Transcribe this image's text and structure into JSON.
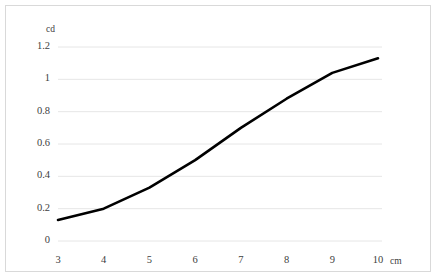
{
  "chart_data": {
    "type": "line",
    "title": "",
    "xlabel": "cm",
    "ylabel": "cd",
    "x": [
      3,
      4,
      5,
      6,
      7,
      8,
      9,
      10
    ],
    "values": [
      0.13,
      0.2,
      0.33,
      0.5,
      0.7,
      0.88,
      1.04,
      1.13
    ],
    "series": [
      {
        "name": "",
        "values": [
          0.13,
          0.2,
          0.33,
          0.5,
          0.7,
          0.88,
          1.04,
          1.13
        ]
      }
    ],
    "xlim": [
      3,
      10
    ],
    "ylim": [
      0,
      1.2
    ],
    "xticks": [
      "3",
      "4",
      "5",
      "6",
      "7",
      "8",
      "9",
      "10"
    ],
    "yticks": [
      "0",
      "0.2",
      "0.4",
      "0.6",
      "0.8",
      "1",
      "1.2"
    ],
    "ytick_values": [
      0,
      0.2,
      0.4,
      0.6,
      0.8,
      1,
      1.2
    ],
    "grid": "horizontal",
    "legend": "none",
    "line_color": "#000000",
    "grid_color": "#e6e6e6",
    "border_color": "#d9d9d9",
    "text_color": "#404040"
  },
  "axes": {
    "y_title": "cd",
    "x_title": "cm"
  },
  "y_ticks": [
    {
      "label": "1.2"
    },
    {
      "label": "1"
    },
    {
      "label": "0.8"
    },
    {
      "label": "0.6"
    },
    {
      "label": "0.4"
    },
    {
      "label": "0.2"
    },
    {
      "label": "0"
    }
  ],
  "x_ticks": [
    {
      "label": "3"
    },
    {
      "label": "4"
    },
    {
      "label": "5"
    },
    {
      "label": "6"
    },
    {
      "label": "7"
    },
    {
      "label": "8"
    },
    {
      "label": "9"
    },
    {
      "label": "10"
    }
  ]
}
